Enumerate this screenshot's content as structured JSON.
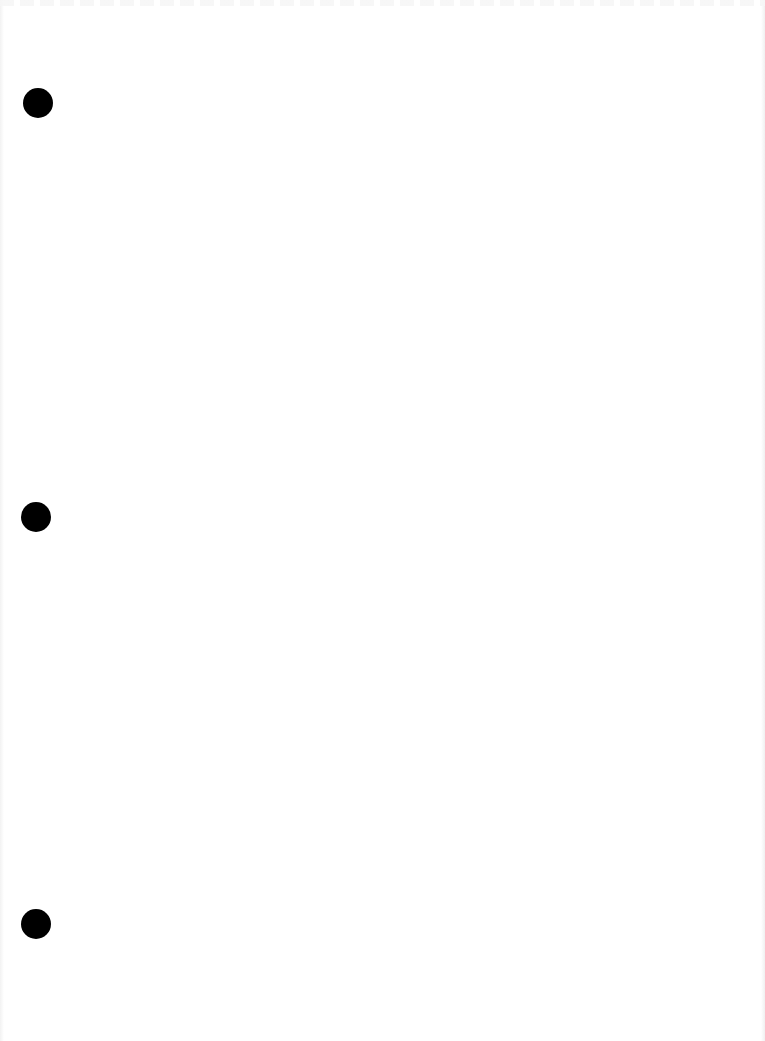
{
  "document": {
    "type": "blank scanned page",
    "background_color": "#ffffff",
    "punch_holes": [
      {
        "name": "top",
        "cx": 38,
        "cy": 103,
        "diameter": 30,
        "color": "#000000"
      },
      {
        "name": "middle",
        "cx": 36,
        "cy": 517,
        "diameter": 30,
        "color": "#000000"
      },
      {
        "name": "bottom",
        "cx": 36,
        "cy": 924,
        "diameter": 30,
        "color": "#000000"
      }
    ]
  }
}
